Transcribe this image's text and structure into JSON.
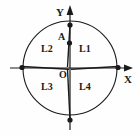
{
  "figure": {
    "kind": "geometry-diagram",
    "ink_color": "#1a1a1a",
    "background_color": "#fefefe"
  },
  "axes": {
    "x_label": "X",
    "y_label": "Y",
    "origin_label": "O"
  },
  "points": [
    {
      "name": "A",
      "label": "A",
      "cx": 70,
      "cy": 43
    },
    {
      "name": "circle-top",
      "label": "",
      "cx": 70,
      "cy": 25
    },
    {
      "name": "circle-bottom",
      "label": "",
      "cx": 70,
      "cy": 120
    },
    {
      "name": "circle-left",
      "label": "",
      "cx": 22,
      "cy": 68
    },
    {
      "name": "circle-right",
      "label": "",
      "cx": 118,
      "cy": 68
    }
  ],
  "regions": [
    {
      "name": "L1",
      "label": "L1",
      "x": 79,
      "y": 48
    },
    {
      "name": "L2",
      "label": "L2",
      "x": 43,
      "y": 48
    },
    {
      "name": "L3",
      "label": "L3",
      "x": 43,
      "y": 84
    },
    {
      "name": "L4",
      "label": "L4",
      "x": 79,
      "y": 84
    }
  ],
  "circle": {
    "cx": 70,
    "cy": 68,
    "r": 47
  }
}
